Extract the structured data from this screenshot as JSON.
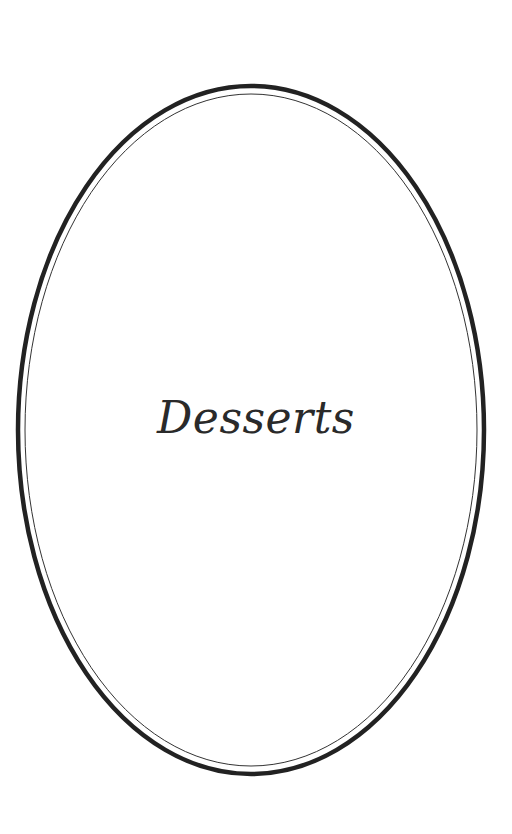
{
  "page": {
    "title": "Desserts"
  },
  "frame": {
    "outer_color": "#222222",
    "inner_color": "#333333",
    "background": "#ffffff"
  }
}
